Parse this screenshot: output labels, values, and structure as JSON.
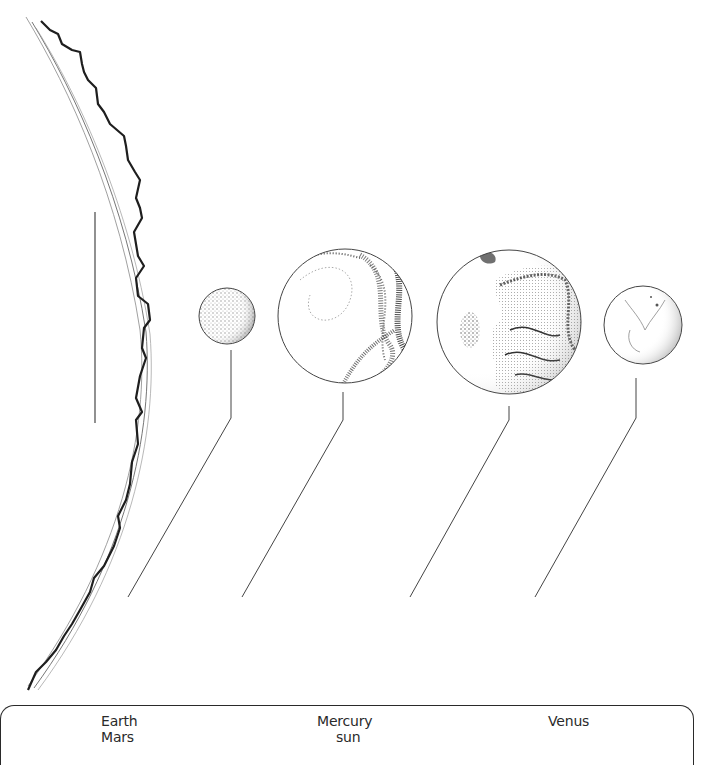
{
  "diagram": {
    "title": "",
    "colors": {
      "ink": "#2a2a2a",
      "paper": "#ffffff",
      "shade": "#555555"
    },
    "sun_edge": {
      "label_slot": "sun",
      "label_line": {
        "x": 95,
        "y1": 212,
        "y2": 423
      }
    },
    "planets": [
      {
        "id": "planet-1",
        "icon": "small-dotted-planet-icon",
        "cx": 227,
        "cy": 316,
        "r": 28,
        "leader": [
          [
            231,
            350
          ],
          [
            231,
            418
          ],
          [
            128,
            597
          ]
        ]
      },
      {
        "id": "planet-2",
        "icon": "swirled-planet-icon",
        "cx": 345,
        "cy": 316,
        "r": 67,
        "leader": [
          [
            343,
            392
          ],
          [
            343,
            420
          ],
          [
            242,
            597
          ]
        ]
      },
      {
        "id": "planet-3",
        "icon": "continents-planet-icon",
        "cx": 509,
        "cy": 322,
        "r": 72,
        "leader": [
          [
            509,
            406
          ],
          [
            509,
            420
          ],
          [
            410,
            597
          ]
        ]
      },
      {
        "id": "planet-4",
        "icon": "cratered-planet-icon",
        "cx": 643,
        "cy": 325,
        "r": 39,
        "leader": [
          [
            636,
            378
          ],
          [
            636,
            418
          ],
          [
            535,
            597
          ]
        ]
      }
    ]
  },
  "word_bank": {
    "words": [
      {
        "text": "Earth",
        "x": 101,
        "y": 713
      },
      {
        "text": "Mars",
        "x": 101,
        "y": 729
      },
      {
        "text": "Mercury",
        "x": 317,
        "y": 713
      },
      {
        "text": "sun",
        "x": 335,
        "y": 729
      },
      {
        "text": "Venus",
        "x": 548,
        "y": 713
      }
    ]
  }
}
